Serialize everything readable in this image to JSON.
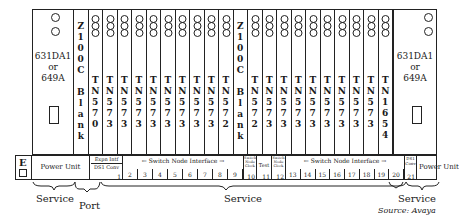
{
  "diagram": {
    "type": "cabinet-slot-layout",
    "power_unit_left": {
      "model_line1": "631DA1",
      "model_line2": "or",
      "model_line3": "649A"
    },
    "power_unit_right": {
      "model_line1": "631DA1",
      "model_line2": "or",
      "model_line3": "649A"
    },
    "slots_top": [
      {
        "id": "z100c-left",
        "chars": [
          "Z",
          "1",
          "0",
          "0",
          "C",
          "",
          "B",
          "l",
          "a",
          "n",
          "k"
        ],
        "leds": false
      },
      {
        "id": "1",
        "chars": [
          "T",
          "N",
          "5",
          "7",
          "0"
        ],
        "leds": true
      },
      {
        "id": "2",
        "chars": [
          "T",
          "N",
          "5",
          "7",
          "3"
        ],
        "leds": true
      },
      {
        "id": "3",
        "chars": [
          "T",
          "N",
          "5",
          "7",
          "3"
        ],
        "leds": true
      },
      {
        "id": "4",
        "chars": [
          "T",
          "N",
          "5",
          "7",
          "3"
        ],
        "leds": true
      },
      {
        "id": "5",
        "chars": [
          "T",
          "N",
          "5",
          "7",
          "3"
        ],
        "leds": true
      },
      {
        "id": "6",
        "chars": [
          "T",
          "N",
          "5",
          "7",
          "3"
        ],
        "leds": true
      },
      {
        "id": "7",
        "chars": [
          "T",
          "N",
          "5",
          "7",
          "3"
        ],
        "leds": true
      },
      {
        "id": "8",
        "chars": [
          "T",
          "N",
          "5",
          "7",
          "3"
        ],
        "leds": true
      },
      {
        "id": "9",
        "chars": [
          "T",
          "N",
          "5",
          "7",
          "3"
        ],
        "leds": true
      },
      {
        "id": "10",
        "chars": [
          "T",
          "N",
          "5",
          "7",
          "2"
        ],
        "leds": true
      },
      {
        "id": "z100c-mid",
        "chars": [
          "Z",
          "1",
          "0",
          "0",
          "C",
          "",
          "B",
          "l",
          "a",
          "n",
          "k"
        ],
        "leds": false
      },
      {
        "id": "12",
        "chars": [
          "T",
          "N",
          "5",
          "7",
          "2"
        ],
        "leds": true
      },
      {
        "id": "13",
        "chars": [
          "T",
          "N",
          "5",
          "7",
          "3"
        ],
        "leds": true
      },
      {
        "id": "14",
        "chars": [
          "T",
          "N",
          "5",
          "7",
          "3"
        ],
        "leds": true
      },
      {
        "id": "15",
        "chars": [
          "T",
          "N",
          "5",
          "7",
          "3"
        ],
        "leds": true
      },
      {
        "id": "16",
        "chars": [
          "T",
          "N",
          "5",
          "7",
          "3"
        ],
        "leds": true
      },
      {
        "id": "17",
        "chars": [
          "T",
          "N",
          "5",
          "7",
          "3"
        ],
        "leds": true
      },
      {
        "id": "18",
        "chars": [
          "T",
          "N",
          "5",
          "7",
          "3"
        ],
        "leds": true
      },
      {
        "id": "19",
        "chars": [
          "T",
          "N",
          "5",
          "7",
          "3"
        ],
        "leds": true
      },
      {
        "id": "20",
        "chars": [
          "T",
          "N",
          "5",
          "7",
          "3"
        ],
        "leds": true
      },
      {
        "id": "21",
        "chars": [
          "T",
          "N",
          "1",
          "6",
          "5",
          "4"
        ],
        "leds": true
      }
    ],
    "label_row": {
      "e_label": "E",
      "power_unit_left": "Power Unit",
      "expn_intf": "Expn Intf",
      "ds1_conv_left": "DS1 Conv",
      "slot1": "1",
      "sni_left": "← Switch Node Interface →",
      "sni_left_numbers": [
        "2",
        "3",
        "4",
        "5",
        "6",
        "7",
        "8",
        "9"
      ],
      "switch_node_clock_left": "Switch Node Clock",
      "slot10": "10",
      "test": "Test",
      "slot11": "11",
      "switch_node_clock_right": "Switch Node Clock",
      "slot12": "12",
      "sni_right": "← Switch Node Interface →",
      "sni_right_numbers": [
        "13",
        "14",
        "15",
        "16",
        "17",
        "18",
        "19",
        "20"
      ],
      "ds1_conv_right": "DS1 Conv",
      "slot21": "21",
      "power_unit_right": "Power Unit"
    },
    "groups": [
      {
        "label": "Service",
        "position": "left"
      },
      {
        "label": "Port",
        "position": "left-center"
      },
      {
        "label": "Service",
        "position": "center"
      },
      {
        "label": "Service",
        "position": "right"
      }
    ],
    "source": "Source: Avaya"
  }
}
